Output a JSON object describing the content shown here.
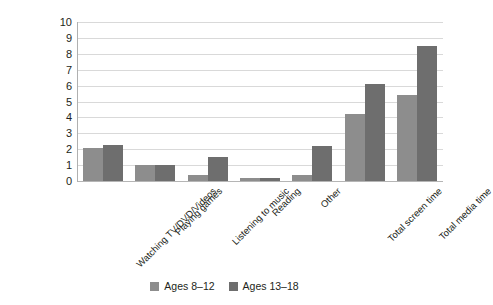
{
  "chart_data": {
    "type": "bar",
    "title": "",
    "subtitle": "",
    "xlabel": "",
    "ylabel": "",
    "ylim": [
      0,
      10
    ],
    "yticks": [
      0,
      1,
      2,
      3,
      4,
      5,
      6,
      7,
      8,
      9,
      10
    ],
    "grid": true,
    "legend_position": "bottom",
    "categories": [
      "Watching TV/DVD/Videos",
      "Playing games",
      "Listening to music",
      "Reading",
      "Other",
      "Total screen time",
      "Total media time"
    ],
    "series": [
      {
        "name": "Ages 8–12",
        "color": "#8d8d8d",
        "values": [
          2.1,
          1.0,
          0.4,
          0.2,
          0.4,
          4.2,
          5.4
        ]
      },
      {
        "name": "Ages 13–18",
        "color": "#6e6e6e",
        "values": [
          2.25,
          1.0,
          1.5,
          0.2,
          2.2,
          6.1,
          8.5
        ]
      }
    ]
  },
  "legend": {
    "items": [
      {
        "label": "Ages 8–12",
        "color": "#8d8d8d"
      },
      {
        "label": "Ages 13–18",
        "color": "#6e6e6e"
      }
    ]
  },
  "colors": {
    "series_light": "#8d8d8d",
    "series_dark": "#6e6e6e",
    "gridline": "#d9d9d9",
    "axis": "#b0b0b0",
    "text": "#231f20",
    "background": "#ffffff"
  }
}
